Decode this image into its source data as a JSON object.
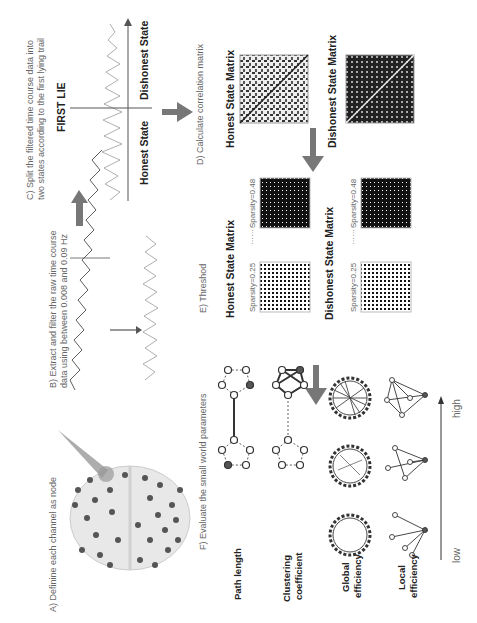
{
  "captions": {
    "a": "A) Definine each channel as node",
    "b_line1": "B) Extract and filter the raw time course",
    "b_line2": "data using between 0.008 and 0.09 Hz",
    "c_line1": "C) Split the filtered time course data into",
    "c_line2": "two states according to the first lying trail",
    "d": "D) Calculate correlation matrix",
    "e": "E) Threshod",
    "f": "F) Evaluate the small world parameters"
  },
  "split": {
    "marker": "FIRST LIE",
    "left": "Honest State",
    "right": "Dishonest State"
  },
  "matrices": {
    "honest": "Honest State Matrix",
    "dishonest": "Dishonest State Matrix"
  },
  "threshold": {
    "honest_title": "Honest State Matrix",
    "dishonest_title": "Dishonest State Matrix",
    "sparsity_low": "Sparsity=0.25",
    "sparsity_high": "Sparsity=0.48",
    "ellipsis": "·······"
  },
  "parameters": {
    "rows": [
      "Path length",
      "Clustering coefficient",
      "Global efficiency",
      "Local efficiency"
    ],
    "path_length": "Path length",
    "clustering_1": "Clustering",
    "clustering_2": "coefficient",
    "global_1": "Global",
    "global_2": "efficiency",
    "local_1": "Local",
    "local_2": "efficiency"
  },
  "scale": {
    "low": "low",
    "high": "high"
  },
  "colors": {
    "arrow": "#777777",
    "text": "#222222",
    "caption": "#666666",
    "node": "#555555"
  }
}
